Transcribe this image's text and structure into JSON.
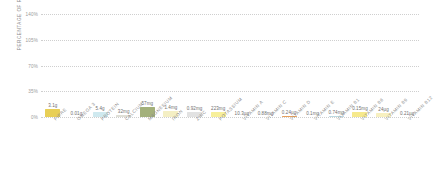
{
  "chart_data": {
    "type": "bar",
    "title": "",
    "subtitle": "",
    "xlabel": "",
    "ylabel": "PERCENTAGE OF RDA",
    "ylim": [
      0,
      140
    ],
    "yticks": [
      "0%",
      "35%",
      "70%",
      "105%",
      "140%"
    ],
    "ytick_values": [
      0,
      35,
      70,
      105,
      140
    ],
    "grid": true,
    "grid_style": "dotted",
    "legend": null,
    "categories": [
      "FIBRE",
      "OMEGA 3",
      "PROTEIN",
      "CALCIUM",
      "MAGNESIUM",
      "IRON",
      "ZINC",
      "POTASSIUM",
      "VITAMIN A",
      "VITAMIN C",
      "VITAMIN D",
      "VITAMIN E",
      "VITAMIN B1",
      "VITAMIN B6",
      "VITAMIN B9",
      "VITAMIN B12"
    ],
    "values": [
      10.5,
      0,
      6.5,
      3.0,
      14.0,
      7.5,
      7.0,
      6.5,
      0,
      0,
      1.5,
      0,
      1.5,
      6.5,
      5.5,
      0
    ],
    "data_labels": [
      "3.1g",
      "0.01g",
      "5.4g",
      "32mg",
      "57mg",
      "1.4mg",
      "0.92mg",
      "223mg",
      "10.3µg",
      "0.88mg",
      "0.24µg",
      "0.1mg",
      "0.74mg",
      "0.15mg",
      "24µg",
      "0.21µg"
    ],
    "bar_colors": [
      "#e8cf56",
      "#ffffff",
      "#cfe9ef",
      "#dfdfd6",
      "#a3b07a",
      "#f4efc4",
      "#e2e2e2",
      "#f7ef9a",
      "#ffffff",
      "#ffffff",
      "#e8a05a",
      "#ffffff",
      "#bcd9e2",
      "#f6e98c",
      "#f7f0c0",
      "#ffffff"
    ],
    "axis_color": "#cfcfcf",
    "label_color": "#8a8a8a"
  }
}
